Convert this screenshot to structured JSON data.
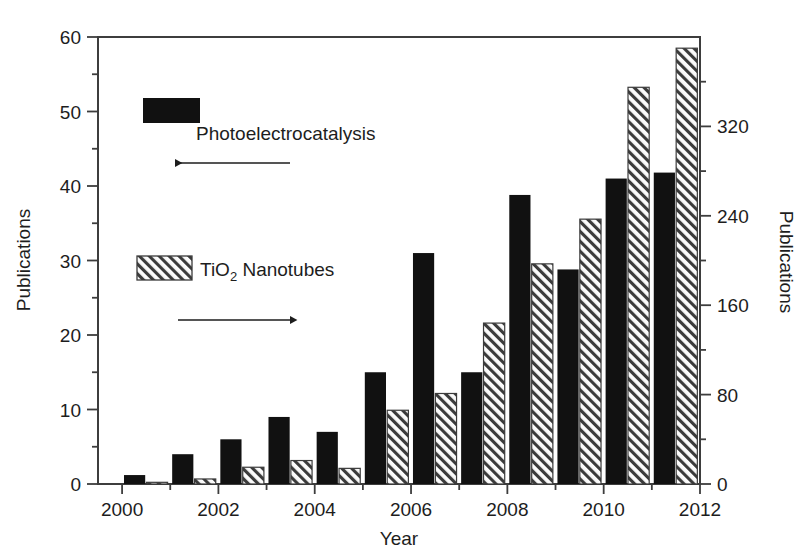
{
  "chart_data": {
    "type": "bar",
    "title": "",
    "subtitle": "",
    "xlabel": "Year",
    "ylabel": "Publications",
    "ylabel_right": "Publications",
    "xlim": [
      1999.5,
      2012
    ],
    "ylim": [
      0,
      60
    ],
    "ylim_right": [
      0,
      400
    ],
    "grid": false,
    "legend_position": "inside-upper-left",
    "x_tick_labels": [
      "2000",
      "2002",
      "2004",
      "2006",
      "2008",
      "2010",
      "2012"
    ],
    "x_tick_values": [
      2000,
      2002,
      2004,
      2006,
      2008,
      2010,
      2012
    ],
    "x_minor_step": 1,
    "y_tick_labels": [
      "0",
      "10",
      "20",
      "30",
      "40",
      "50",
      "60"
    ],
    "y_tick_values": [
      0,
      10,
      20,
      30,
      40,
      50,
      60
    ],
    "y_minor_step": 5,
    "y_right_tick_labels": [
      "0",
      "80",
      "160",
      "240",
      "320"
    ],
    "y_right_tick_values": [
      0,
      80,
      160,
      240,
      320
    ],
    "y_right_minor_step": 40,
    "categories": [
      2000,
      2001,
      2002,
      2003,
      2004,
      2005,
      2006,
      2007,
      2008,
      2009,
      2010,
      2011
    ],
    "series": [
      {
        "name": "Photoelectrocatalysis",
        "axis": "left",
        "fill": "solid-black",
        "color": "#111111",
        "values": [
          1.2,
          4.0,
          6.0,
          9.0,
          7.0,
          15.0,
          31.0,
          15.0,
          38.8,
          28.8,
          41.0,
          41.8
        ]
      },
      {
        "name": "TiO2 Nanotubes",
        "axis": "right",
        "fill": "hatched-diagonal",
        "color": "#f2f2f2",
        "values": [
          1.5,
          4.5,
          15.0,
          21.0,
          14.0,
          66.0,
          81.0,
          144.0,
          197.0,
          237.0,
          355.0,
          390.0
        ],
        "values_left_scale": [
          0.25,
          0.7,
          2.3,
          3.2,
          2.2,
          10.0,
          12.2,
          21.7,
          29.6,
          35.6,
          53.3,
          58.6
        ]
      }
    ],
    "annotations": [
      {
        "id": "legend-black",
        "label": "Photoelectrocatalysis",
        "swatch": "solid-black",
        "arrow": "left"
      },
      {
        "id": "legend-hatch",
        "label": "TiO",
        "label_sub": "2",
        "label_rest": " Nanotubes",
        "swatch": "hatched-diagonal",
        "arrow": "right"
      }
    ]
  },
  "legend": {
    "photoelectrocatalysis_label": "Photoelectrocatalysis",
    "tio2_prefix": "TiO",
    "tio2_subscript": "2",
    "tio2_suffix": " Nanotubes"
  },
  "axes": {
    "left_title": "Publications",
    "right_title": "Publications",
    "bottom_title": "Year",
    "left_ticks": [
      "60",
      "50",
      "40",
      "30",
      "20",
      "10",
      "0"
    ],
    "right_ticks": [
      "320",
      "240",
      "160",
      "80",
      "0"
    ],
    "bottom_ticks": [
      "2000",
      "2002",
      "2004",
      "2006",
      "2008",
      "2010",
      "2012"
    ]
  },
  "colors": {
    "bar_solid": "#111111",
    "bar_hatch_bg": "#fbfbfb",
    "bar_hatch_line": "#3b3b3b",
    "axis": "#3d3d3d",
    "text": "#1d1d1d",
    "background": "#ffffff"
  }
}
